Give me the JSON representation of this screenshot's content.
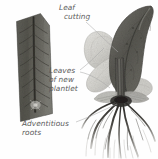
{
  "figure": {
    "name": "leaf-cutting-propagation-diagram",
    "background_color": "#fefefe",
    "width": 158,
    "height": 159
  },
  "labels": {
    "leaf_cutting": {
      "line1": "Leaf",
      "line2": "cutting"
    },
    "leaves_of_new_plantlet": {
      "line1": "Leaves",
      "line2": "of new",
      "line3": "plantlet"
    },
    "adventitious_roots": {
      "line1": "Adventitious",
      "line2": "roots"
    }
  },
  "illustration": {
    "leaf_cutting_piece": "leaf-cutting-wedge",
    "parent_leaf": "large-curved-dark-leaf",
    "young_leaves": "pale-rounded-plantlet-leaves",
    "roots": "branching-adventitious-roots",
    "leader_lines": "thin-gray-pointer-lines"
  },
  "colors": {
    "text": "#5a5a5a",
    "leader_line": "#a9a9a9",
    "cutting_dark": "#55544f",
    "cutting_mid": "#6d6c66",
    "cutting_vein": "#3c3b37",
    "leaf_dark": "#5d5c58",
    "leaf_mid": "#7e7d78",
    "plantlet_pale": "#d5d4cf",
    "root_dark": "#2e2d2a",
    "root_pale": "#bdbcb8"
  }
}
